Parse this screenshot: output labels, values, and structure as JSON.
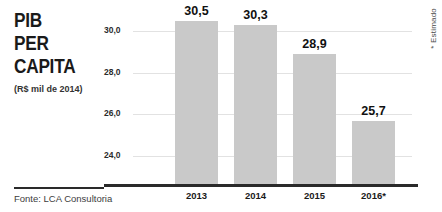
{
  "title": {
    "lines": [
      "PIB",
      "PER",
      "CAPITA"
    ],
    "subtitle": "(R$ mil de 2014)"
  },
  "note": "* Estimado",
  "source": "Fonte: LCA Consultoria",
  "chart_data": {
    "type": "bar",
    "title": "PIB PER CAPITA",
    "subtitle": "(R$ mil de 2014)",
    "xlabel": "",
    "ylabel": "R$ mil de 2014",
    "categories": [
      "2013",
      "2014",
      "2015",
      "2016*"
    ],
    "values": [
      30.5,
      30.3,
      28.9,
      25.7
    ],
    "value_labels": [
      "30,5",
      "30,3",
      "28,9",
      "25,7"
    ],
    "ytick_values": [
      30.0,
      28.0,
      26.0,
      24.0
    ],
    "ytick_labels": [
      "30,0",
      "28,0",
      "26,0",
      "24,0"
    ],
    "ylim": [
      22.65,
      31.5
    ],
    "grid": true,
    "legend": false,
    "bar_color": "#c9c9c9",
    "axis_color": "#2a2a2a",
    "grid_color": "#e2e2e2",
    "annotations": [
      "* Estimado"
    ],
    "source": "Fonte: LCA Consultoria"
  }
}
